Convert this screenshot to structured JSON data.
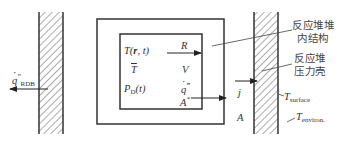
{
  "diagram": {
    "type": "reactor-thermal-model-schematic",
    "left_wall": {
      "flux_label": "q″",
      "flux_label_symbol": "q",
      "flux_label_primes": "″",
      "flux_subscript": "RDB"
    },
    "inner_box": {
      "left_column": [
        {
          "main": "T(",
          "bold": "r",
          "rest": ", t)"
        },
        {
          "main": "T",
          "overbar": true
        },
        {
          "main": "P",
          "subscript": "D",
          "rest": "(t)"
        }
      ],
      "right_column": [
        {
          "main": "R"
        },
        {
          "main": "V"
        },
        {
          "symbol": "q",
          "primes": "‴"
        },
        {
          "main": "A",
          "superscript": "*"
        }
      ]
    },
    "annotations": {
      "internal_structure": [
        "反应堆堆",
        "内结构"
      ],
      "pressure_vessel": [
        "反应堆",
        "压力壳"
      ]
    },
    "symbols": {
      "flux_j": "j",
      "area_A": "A",
      "t_surface": "T",
      "t_surface_sub": "surface",
      "t_environ": "T",
      "t_environ_sub": "environ."
    },
    "colors": {
      "line": "#333333",
      "hatch": "#555555",
      "background": "#ffffff"
    }
  }
}
